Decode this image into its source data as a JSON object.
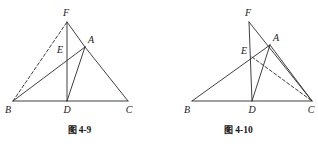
{
  "page": {
    "width": 318,
    "height": 151,
    "background_color": "#ffffff",
    "stroke_color": "#2b2b2b",
    "label_color": "#1a1a1a"
  },
  "figures": [
    {
      "id": "figure-4-9",
      "caption_cjk": "图",
      "caption_number": "4-9",
      "caption_full": "图 4-9",
      "caption_x": 79,
      "caption_y": 131,
      "points": {
        "B": {
          "x": 13,
          "y": 101,
          "label": "B",
          "label_x": 8,
          "label_y": 110
        },
        "D": {
          "x": 67,
          "y": 101,
          "label": "D",
          "label_x": 67,
          "label_y": 110
        },
        "C": {
          "x": 128,
          "y": 101,
          "label": "C",
          "label_x": 129,
          "label_y": 110
        },
        "F": {
          "x": 67,
          "y": 22,
          "label": "F",
          "label_x": 66,
          "label_y": 13
        },
        "A": {
          "x": 85,
          "y": 47,
          "label": "A",
          "label_x": 91,
          "label_y": 40
        },
        "E": {
          "x": 67,
          "y": 56,
          "label": "E",
          "label_x": 60,
          "label_y": 50
        }
      },
      "segments": [
        {
          "name": "base-BC",
          "from": "B",
          "to": "C",
          "style": "solid"
        },
        {
          "name": "cevian-FD",
          "from": "F",
          "to": "D",
          "style": "solid"
        },
        {
          "name": "side-FA",
          "from": "F",
          "to": "A",
          "style": "solid"
        },
        {
          "name": "side-AC",
          "from": "A",
          "to": "C",
          "style": "solid"
        },
        {
          "name": "cevian-AD",
          "from": "A",
          "to": "D",
          "style": "solid"
        },
        {
          "name": "cevian-BA",
          "from": "B",
          "to": "A",
          "style": "solid"
        },
        {
          "name": "dashed-BF",
          "from": "B",
          "to": "F",
          "style": "dashed"
        }
      ]
    },
    {
      "id": "figure-4-10",
      "caption_cjk": "图",
      "caption_number": "4-10",
      "caption_full": "图 4-10",
      "caption_x": 79,
      "caption_y": 131,
      "points": {
        "B": {
          "x": 33,
          "y": 101,
          "label": "B",
          "label_x": 28,
          "label_y": 110
        },
        "D": {
          "x": 93,
          "y": 101,
          "label": "D",
          "label_x": 93,
          "label_y": 110
        },
        "C": {
          "x": 153,
          "y": 101,
          "label": "C",
          "label_x": 152,
          "label_y": 110
        },
        "F": {
          "x": 90,
          "y": 22,
          "label": "F",
          "label_x": 89,
          "label_y": 13
        },
        "A": {
          "x": 111,
          "y": 45,
          "label": "A",
          "label_x": 117,
          "label_y": 38
        },
        "E": {
          "x": 93,
          "y": 57,
          "label": "E",
          "label_x": 85,
          "label_y": 51
        }
      },
      "segments": [
        {
          "name": "base-BC",
          "from": "B",
          "to": "C",
          "style": "solid"
        },
        {
          "name": "cevian-FD",
          "from": "F",
          "to": "D",
          "style": "solid"
        },
        {
          "name": "line-FC",
          "from": "F",
          "to": "C",
          "style": "solid"
        },
        {
          "name": "cevian-AD",
          "from": "A",
          "to": "D",
          "style": "solid"
        },
        {
          "name": "cevian-BA",
          "from": "B",
          "to": "A",
          "style": "solid"
        },
        {
          "name": "side-AC",
          "from": "A",
          "to": "C",
          "style": "solid"
        },
        {
          "name": "dashed-EC",
          "from": "E",
          "to": "C",
          "style": "dashed"
        }
      ]
    }
  ]
}
